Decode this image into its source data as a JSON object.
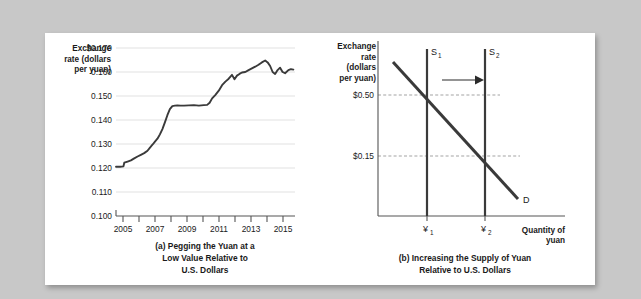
{
  "figure": {
    "background_color": "#c8c8c8",
    "panel_color": "#ffffff"
  },
  "chart_data": [
    {
      "type": "line",
      "id": "chart-a",
      "title": "",
      "caption": [
        "(a) Pegging the Yuan at a",
        "Low Value Relative to",
        "U.S. Dollars"
      ],
      "ylabel": [
        "Exchange",
        "rate (dollars",
        "per yuan)"
      ],
      "xlabel": "",
      "ylim": [
        0.1,
        0.17
      ],
      "xlim": [
        2005,
        2015.8
      ],
      "grid": true,
      "legend": "none",
      "ytick_labels": [
        "$0.170",
        "0.160",
        "0.150",
        "0.140",
        "0.130",
        "0.120",
        "0.110",
        "0.100"
      ],
      "ytick_values": [
        0.17,
        0.16,
        0.15,
        0.14,
        0.13,
        0.12,
        0.11,
        0.1
      ],
      "xtick_labels": [
        "2005",
        "2007",
        "2009",
        "2011",
        "2013",
        "2015"
      ],
      "xtick_values": [
        2005,
        2007,
        2009,
        2011,
        2013,
        2015
      ],
      "x": [
        2005.0,
        2005.25,
        2005.45,
        2005.5,
        2005.7,
        2005.9,
        2006.1,
        2006.3,
        2006.5,
        2006.7,
        2006.9,
        2007.05,
        2007.2,
        2007.35,
        2007.5,
        2007.65,
        2007.8,
        2007.95,
        2008.1,
        2008.25,
        2008.4,
        2008.55,
        2008.7,
        2008.9,
        2009.1,
        2009.4,
        2009.7,
        2010.0,
        2010.3,
        2010.5,
        2010.65,
        2010.8,
        2011.0,
        2011.2,
        2011.4,
        2011.6,
        2011.8,
        2012.0,
        2012.15,
        2012.3,
        2012.45,
        2012.6,
        2012.8,
        2013.0,
        2013.2,
        2013.4,
        2013.6,
        2013.8,
        2014.0,
        2014.15,
        2014.3,
        2014.45,
        2014.6,
        2014.75,
        2014.9,
        2015.05,
        2015.2,
        2015.4,
        2015.55,
        2015.7
      ],
      "y": [
        0.1205,
        0.1205,
        0.1207,
        0.1222,
        0.1227,
        0.1232,
        0.124,
        0.1248,
        0.1255,
        0.1262,
        0.1272,
        0.1285,
        0.1297,
        0.131,
        0.1322,
        0.134,
        0.1362,
        0.139,
        0.142,
        0.1445,
        0.1458,
        0.146,
        0.1461,
        0.146,
        0.146,
        0.1461,
        0.1462,
        0.146,
        0.1462,
        0.1463,
        0.1472,
        0.149,
        0.1505,
        0.1522,
        0.1545,
        0.156,
        0.1572,
        0.1588,
        0.157,
        0.1585,
        0.1592,
        0.1598,
        0.16,
        0.1608,
        0.1615,
        0.1622,
        0.163,
        0.164,
        0.1648,
        0.164,
        0.1625,
        0.16,
        0.1592,
        0.1608,
        0.1618,
        0.16,
        0.1595,
        0.1608,
        0.1612,
        0.161
      ]
    },
    {
      "type": "line",
      "id": "chart-b",
      "title": "",
      "caption": [
        "(b) Increasing the Supply of Yuan",
        "Relative to U.S. Dollars"
      ],
      "ylabel": [
        "Exchange",
        "rate",
        "(dollars",
        "per yuan)"
      ],
      "xlabel": [
        "Quantity of",
        "yuan"
      ],
      "grid": false,
      "legend": "none",
      "ytick_labels": [
        "$0.50",
        "$0.15"
      ],
      "xtick_labels": [
        "¥",
        "¥"
      ],
      "xtick_subscripts": [
        "1",
        "2"
      ],
      "series": [
        {
          "name": "S",
          "subscript": "1",
          "kind": "vertical-supply"
        },
        {
          "name": "S",
          "subscript": "2",
          "kind": "vertical-supply"
        },
        {
          "name": "D",
          "subscript": "",
          "kind": "demand"
        }
      ],
      "annotations": [
        "shift-arrow"
      ]
    }
  ]
}
